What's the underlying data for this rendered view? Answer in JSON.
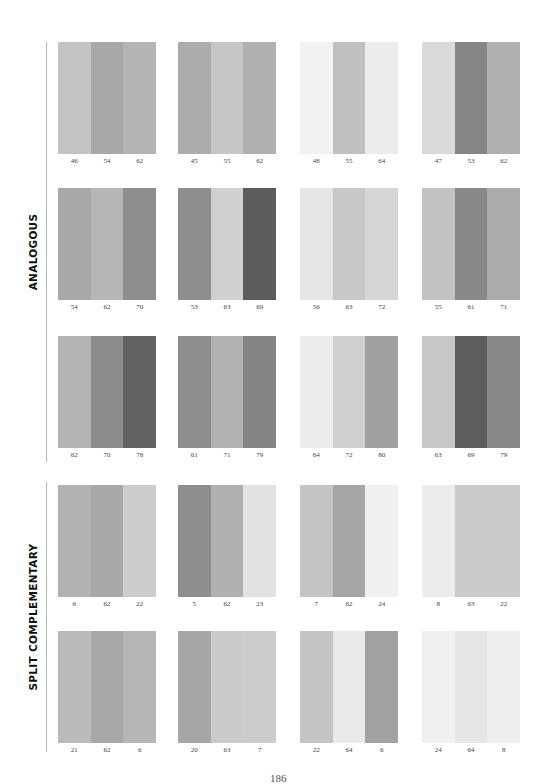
{
  "sections": [
    {
      "label": "ANALOGOUS",
      "rows": [
        [
          {
            "values": [
              "46",
              "54",
              "62"
            ],
            "colors": [
              "#c4c4c4",
              "#a8a8a8",
              "#b4b4b4"
            ]
          },
          {
            "values": [
              "45",
              "55",
              "62"
            ],
            "colors": [
              "#acacac",
              "#c6c6c6",
              "#b0b0b0"
            ]
          },
          {
            "values": [
              "48",
              "55",
              "64"
            ],
            "colors": [
              "#f2f2f2",
              "#c0c0c0",
              "#ececec"
            ]
          },
          {
            "values": [
              "47",
              "53",
              "62"
            ],
            "colors": [
              "#dadada",
              "#868686",
              "#b0b0b0"
            ]
          }
        ],
        [
          {
            "values": [
              "54",
              "62",
              "70"
            ],
            "colors": [
              "#a8a8a8",
              "#b6b6b6",
              "#8e8e8e"
            ]
          },
          {
            "values": [
              "53",
              "63",
              "69"
            ],
            "colors": [
              "#8e8e8e",
              "#d0d0d0",
              "#5c5c5c"
            ]
          },
          {
            "values": [
              "56",
              "63",
              "72"
            ],
            "colors": [
              "#e6e6e6",
              "#c8c8c8",
              "#d6d6d6"
            ]
          },
          {
            "values": [
              "55",
              "61",
              "71"
            ],
            "colors": [
              "#c2c2c2",
              "#888888",
              "#ababab"
            ]
          }
        ],
        [
          {
            "values": [
              "62",
              "70",
              "78"
            ],
            "colors": [
              "#b4b4b4",
              "#8c8c8c",
              "#626262"
            ]
          },
          {
            "values": [
              "61",
              "71",
              "79"
            ],
            "colors": [
              "#8e8e8e",
              "#b2b2b2",
              "#848484"
            ]
          },
          {
            "values": [
              "64",
              "72",
              "80"
            ],
            "colors": [
              "#ececec",
              "#d0d0d0",
              "#a0a0a0"
            ]
          },
          {
            "values": [
              "63",
              "69",
              "79"
            ],
            "colors": [
              "#c8c8c8",
              "#5e5e5e",
              "#888888"
            ]
          }
        ]
      ]
    },
    {
      "label": "SPLIT COMPLEMENTARY",
      "rows": [
        [
          {
            "values": [
              "6",
              "62",
              "22"
            ],
            "colors": [
              "#b2b2b2",
              "#a8a8a8",
              "#cccccc"
            ]
          },
          {
            "values": [
              "5",
              "62",
              "23"
            ],
            "colors": [
              "#8e8e8e",
              "#b0b0b0",
              "#e2e2e2"
            ]
          },
          {
            "values": [
              "7",
              "62",
              "24"
            ],
            "colors": [
              "#c4c4c4",
              "#a6a6a6",
              "#f0f0f0"
            ]
          },
          {
            "values": [
              "8",
              "63",
              "22"
            ],
            "colors": [
              "#ececec",
              "#cacaca",
              "#cacaca"
            ]
          }
        ],
        [
          {
            "values": [
              "21",
              "62",
              "6"
            ],
            "colors": [
              "#bababa",
              "#a8a8a8",
              "#b6b6b6"
            ]
          },
          {
            "values": [
              "20",
              "63",
              "7"
            ],
            "colors": [
              "#a6a6a6",
              "#cacaca",
              "#cccccc"
            ]
          },
          {
            "values": [
              "22",
              "64",
              "6"
            ],
            "colors": [
              "#c4c4c4",
              "#eaeaea",
              "#a2a2a2"
            ]
          },
          {
            "values": [
              "24",
              "64",
              "8"
            ],
            "colors": [
              "#f0f0f0",
              "#e6e6e6",
              "#eeeeee"
            ]
          }
        ]
      ]
    }
  ],
  "page_number": "186"
}
